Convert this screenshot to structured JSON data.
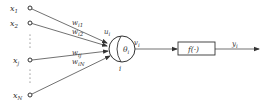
{
  "diagram": {
    "type": "artificial-neuron-model",
    "inputs": [
      {
        "label": "x",
        "sub": "1",
        "y": 8,
        "weight": "w",
        "weight_sub": "i1"
      },
      {
        "label": "x",
        "sub": "2",
        "y": 23,
        "weight": "w",
        "weight_sub": "i2"
      },
      {
        "label": "x",
        "sub": "j",
        "y": 60,
        "weight": "w",
        "weight_sub": "ij"
      },
      {
        "label": "x",
        "sub": "N",
        "y": 95,
        "weight": "w",
        "weight_sub": "iN"
      }
    ],
    "ellipsis": "⋮",
    "neuron": {
      "input_sum_label": "u",
      "input_sum_sub": "i",
      "threshold_label": "θ",
      "threshold_sub": "i",
      "index_label": "i"
    },
    "net_output": {
      "label": "v",
      "sub": "i"
    },
    "activation": {
      "label": "f(·)"
    },
    "output": {
      "label": "y",
      "sub": "i"
    },
    "colors": {
      "stroke": "#333333",
      "background": "#ffffff"
    }
  }
}
